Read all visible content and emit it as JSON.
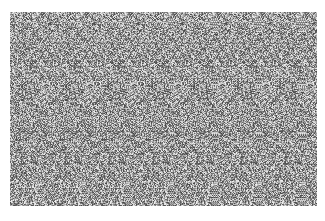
{
  "image": {
    "kind": "autostereogram",
    "description": "Random-dot grayscale stereogram pattern",
    "region": {
      "x": 10,
      "y": 12,
      "width": 307,
      "height": 194
    },
    "background_color": "#ffffff",
    "tone_range": {
      "dark": "#3a3a3a",
      "light": "#e8e8e8"
    },
    "repeat_period_px": 44
  }
}
